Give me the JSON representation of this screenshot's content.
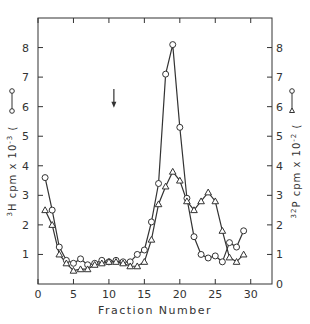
{
  "chart_data": {
    "type": "line",
    "title": "",
    "xlabel": "Fraction Number",
    "ylabel_left": "3H cpm x 10^-3 (circle)",
    "ylabel_right": "32P cpm x 10^-2 (triangle)",
    "xlim": [
      0,
      33
    ],
    "ylim": [
      0,
      9
    ],
    "x_ticks": [
      0,
      5,
      10,
      15,
      20,
      25,
      30
    ],
    "y_ticks": [
      0,
      1,
      2,
      3,
      4,
      5,
      6,
      7,
      8
    ],
    "grid": false,
    "annotations": [
      {
        "type": "arrow-down",
        "x": 10.7,
        "y_from": 6.6,
        "y_to": 6.0
      }
    ],
    "series": [
      {
        "name": "3H (circles)",
        "marker": "circle",
        "axis": "left",
        "x": [
          1,
          2,
          3,
          4,
          5,
          6,
          7,
          8,
          9,
          10,
          11,
          12,
          13,
          14,
          15,
          16,
          17,
          18,
          19,
          20,
          21,
          22,
          23,
          24,
          25,
          26,
          27,
          28,
          29
        ],
        "values": [
          3.6,
          2.5,
          1.25,
          0.8,
          0.7,
          0.85,
          0.65,
          0.7,
          0.8,
          0.75,
          0.8,
          0.75,
          0.75,
          1.0,
          1.15,
          2.1,
          3.4,
          7.1,
          8.1,
          5.3,
          2.9,
          1.6,
          1.0,
          0.88,
          0.95,
          0.75,
          1.4,
          1.25,
          1.8
        ]
      },
      {
        "name": "32P (triangles)",
        "marker": "triangle",
        "axis": "right",
        "x": [
          1,
          2,
          3,
          4,
          5,
          6,
          7,
          8,
          9,
          10,
          11,
          12,
          13,
          14,
          15,
          16,
          17,
          18,
          19,
          20,
          21,
          22,
          23,
          24,
          25,
          26,
          27,
          28,
          29
        ],
        "values": [
          2.5,
          2.0,
          1.0,
          0.7,
          0.45,
          0.5,
          0.5,
          0.65,
          0.7,
          0.75,
          0.75,
          0.7,
          0.6,
          0.6,
          0.75,
          1.5,
          2.7,
          3.3,
          3.8,
          3.5,
          2.8,
          2.5,
          2.8,
          3.1,
          2.8,
          1.8,
          0.9,
          0.75,
          1.0
        ]
      }
    ]
  },
  "labels": {
    "x_axis": "Fraction Number",
    "y_left_main": "H cpm x 10",
    "y_left_sup_pre": "3",
    "y_left_sup_exp": "-3",
    "y_right_main": "P cpm x 10",
    "y_right_sup_pre": "32",
    "y_right_sup_exp": "-2"
  }
}
